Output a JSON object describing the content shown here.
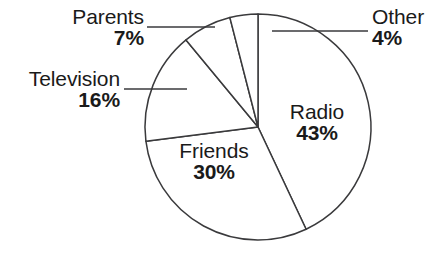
{
  "chart_data": {
    "type": "pie",
    "title": "",
    "subtitle": "",
    "xlabel": "",
    "ylabel": "",
    "legend_position": "none",
    "grid": false,
    "units": "percent",
    "start_angle_deg": 0,
    "direction": "clockwise",
    "total": 100,
    "categories": [
      "Radio",
      "Friends",
      "Television",
      "Parents",
      "Other"
    ],
    "values": [
      43,
      30,
      16,
      7,
      4
    ],
    "slices": [
      {
        "name": "Radio",
        "label": "Radio",
        "value": 43,
        "value_label": "43%",
        "label_placement": "inside",
        "start_deg": 0,
        "end_deg": 154.8,
        "leader_line": false
      },
      {
        "name": "Friends",
        "label": "Friends",
        "value": 30,
        "value_label": "30%",
        "label_placement": "inside",
        "start_deg": 154.8,
        "end_deg": 262.8,
        "leader_line": false
      },
      {
        "name": "Television",
        "label": "Television",
        "value": 16,
        "value_label": "16%",
        "label_placement": "outside-left",
        "start_deg": 262.8,
        "end_deg": 320.4,
        "leader_line": true
      },
      {
        "name": "Parents",
        "label": "Parents",
        "value": 7,
        "value_label": "7%",
        "label_placement": "outside-left",
        "start_deg": 320.4,
        "end_deg": 345.6,
        "leader_line": true
      },
      {
        "name": "Other",
        "label": "Other",
        "value": 4,
        "value_label": "4%",
        "label_placement": "outside-right",
        "start_deg": 345.6,
        "end_deg": 360,
        "leader_line": true
      }
    ],
    "colors": {
      "slice_fill": "#ffffff",
      "slice_stroke": "#3a3a3c",
      "leader_line": "#3a3a3c",
      "text": "#1a1a1a",
      "background": "#ffffff"
    }
  },
  "chart": {
    "geometry": {
      "center_x": 258,
      "center_y": 127,
      "radius": 113
    }
  }
}
